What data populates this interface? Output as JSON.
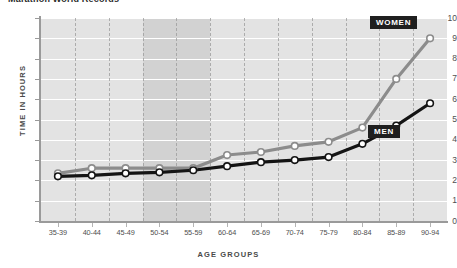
{
  "chart_data": {
    "type": "line",
    "title": "Marathon World Records",
    "xlabel": "AGE GROUPS",
    "ylabel": "TIME IN HOURS",
    "categories": [
      "35-39",
      "40-44",
      "45-49",
      "50-54",
      "55-59",
      "60-64",
      "65-69",
      "70-74",
      "75-79",
      "80-84",
      "85-89",
      "90-94"
    ],
    "yticks": [
      "0",
      "1",
      "2",
      "3",
      "4",
      "5",
      "6",
      "7",
      "8",
      "9",
      "10"
    ],
    "ylim": [
      0,
      10
    ],
    "grid": "horizontal-and-vertical",
    "legend_position": "inline-right",
    "highlight_band": {
      "from": "50-54",
      "to": "55-59"
    },
    "series": [
      {
        "name": "WOMEN",
        "color": "#8c8c8c",
        "marker_fill": "#ffffff",
        "values": [
          2.35,
          2.6,
          2.6,
          2.6,
          2.6,
          3.25,
          3.4,
          3.7,
          3.9,
          4.6,
          7.0,
          9.0
        ]
      },
      {
        "name": "MEN",
        "color": "#141414",
        "marker_fill": "#ffffff",
        "values": [
          2.2,
          2.25,
          2.35,
          2.4,
          2.5,
          2.7,
          2.9,
          3.0,
          3.15,
          3.8,
          4.7,
          5.8
        ]
      }
    ]
  },
  "legend": {
    "women_label": "WOMEN",
    "men_label": "MEN"
  }
}
